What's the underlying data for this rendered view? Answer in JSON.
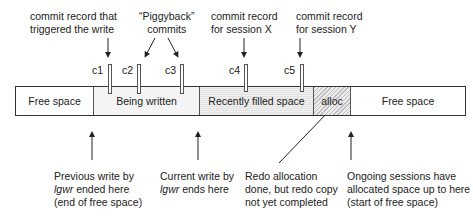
{
  "top_labels": {
    "c1_note": [
      "commit record that",
      "triggered the write"
    ],
    "piggyback_note": [
      "“Piggyback”",
      "commits"
    ],
    "c4_note": [
      "commit record",
      "for session X"
    ],
    "c5_note": [
      "commit record",
      "for session Y"
    ]
  },
  "markers": [
    {
      "id": "c1",
      "label": "c1"
    },
    {
      "id": "c2",
      "label": "c2"
    },
    {
      "id": "c3",
      "label": "c3"
    },
    {
      "id": "c4",
      "label": "c4"
    },
    {
      "id": "c5",
      "label": "c5"
    }
  ],
  "segments": [
    {
      "label": "Free space",
      "type": "free"
    },
    {
      "label": "Being written",
      "type": "writing"
    },
    {
      "label": "Recently filled space",
      "type": "filled"
    },
    {
      "label": "alloc",
      "type": "alloc"
    },
    {
      "label": "Free space",
      "type": "free"
    }
  ],
  "bottom_labels": {
    "previous_write": {
      "lines": [
        "Previous write by",
        "ended here",
        "(end of free space)"
      ],
      "italic_word": "lgwr"
    },
    "current_write": {
      "lines": [
        "Current write by",
        "ends here"
      ],
      "italic_word": "lgwr"
    },
    "redo_allocation": {
      "lines": [
        "Redo allocation",
        "done, but redo copy",
        "not yet completed"
      ]
    },
    "ongoing_sessions": {
      "lines": [
        "Ongoing sessions have",
        "allocated space up to here",
        "(start of free space)"
      ]
    }
  }
}
